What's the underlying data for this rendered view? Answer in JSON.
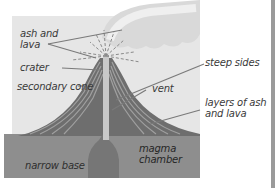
{
  "diagram": {
    "colors": {
      "panel": "#e6e6e6",
      "ground": "#8e8e8e",
      "cone_dark": "#6b6b6b",
      "cone_layer": "#9a9a9a",
      "vent": "#c8c8c8",
      "magma": "#767676",
      "cloud": "#dcdcdc",
      "leader": "#7a7a7a",
      "text": "#3a3a3a"
    },
    "labels": {
      "ash_lava": [
        "ash and",
        "lava"
      ],
      "crater": "crater",
      "secondary_cone": "secondary cone",
      "steep_sides": "steep sides",
      "vent": "vent",
      "layers": [
        "layers of ash",
        "and lava"
      ],
      "narrow_base": "narrow base",
      "magma_chamber": [
        "magma",
        "chamber"
      ]
    }
  }
}
